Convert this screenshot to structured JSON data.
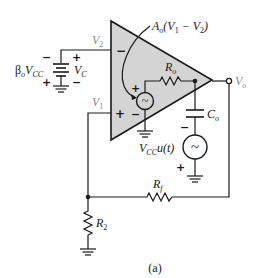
{
  "figure": {
    "caption": "(a)",
    "colors": {
      "opamp_fill": "#d4d4d4",
      "line": "#1a1a1a",
      "label_gray": "#8a8a8a"
    }
  },
  "opamp": {
    "gain_label": "Ao(V1 − V2)",
    "gain_label_parts": {
      "A": "A",
      "o_sub": "o",
      "expr_open": "(V",
      "one_sub": "1",
      "minus": " − V",
      "two_sub": "2",
      "close": ")"
    },
    "inverting_sign": "−",
    "noninverting_sign": "+",
    "internal_source": {
      "plus": "+",
      "minus": "−",
      "symbol": "~"
    },
    "output_resistor": {
      "name": "R",
      "sub": "o"
    }
  },
  "nodes": {
    "v2": {
      "name": "V",
      "sub": "2"
    },
    "v1": {
      "name": "V",
      "sub": "1"
    },
    "vo": {
      "name": "V",
      "sub": "o"
    }
  },
  "battery": {
    "left_label": {
      "beta": "β",
      "beta_sub": "o",
      "name": "V",
      "sub": "CC"
    },
    "right_label": {
      "name": "V",
      "sub": "C"
    },
    "left_top_sign": "−",
    "left_bottom_sign": "+",
    "right_top_sign": "+",
    "right_bottom_sign": "−"
  },
  "output_capacitor": {
    "name": "C",
    "sub": "o"
  },
  "step_source": {
    "label": {
      "name": "V",
      "sub": "CC",
      "suffix": "u(t)"
    },
    "top_sign": "−",
    "bottom_sign": "+",
    "symbol": "~"
  },
  "feedback_resistor": {
    "name": "R",
    "sub": "f"
  },
  "ground_resistor": {
    "name": "R",
    "sub": "2"
  }
}
